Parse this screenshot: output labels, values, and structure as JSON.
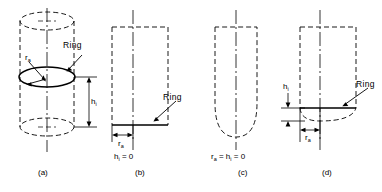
{
  "figure": {
    "title": "",
    "type": "engineering-line-diagram",
    "stroke_color": "#000000",
    "background_color": "#ffffff"
  },
  "panels": [
    {
      "id": "a",
      "caption": "(a)",
      "ring_label": "Ring",
      "radius_symbol": "r",
      "radius_subscript": "a",
      "height_symbol": "h",
      "height_subscript": "i",
      "equation": "",
      "shape": "cylinder-with-ring"
    },
    {
      "id": "b",
      "caption": "(b)",
      "ring_label": "Ring",
      "radius_symbol": "r",
      "radius_subscript": "a",
      "height_symbol": "h",
      "height_subscript": "i",
      "equation_prefix": "h",
      "equation_subscript": "i",
      "equation_suffix": " = 0",
      "shape": "flat-bottom-ring"
    },
    {
      "id": "c",
      "caption": "(c)",
      "ring_label": "",
      "equation_prefix": "r",
      "equation_subscript": "a",
      "equation_mid": " = h",
      "equation_subscript2": "i",
      "equation_suffix": " = 0",
      "shape": "rounded-bottom-no-ring"
    },
    {
      "id": "d",
      "caption": "(d)",
      "ring_label": "Ring",
      "radius_symbol": "r",
      "radius_subscript": "a",
      "height_symbol": "h",
      "height_subscript": "i",
      "equation": "",
      "shape": "ring-above-rounded-bottom"
    }
  ]
}
